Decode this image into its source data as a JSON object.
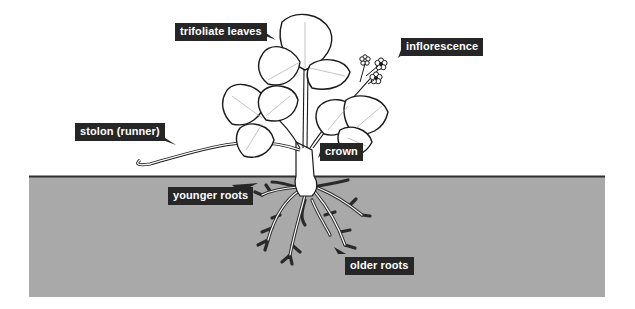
{
  "diagram": {
    "colors": {
      "soil": "#a9a9a9",
      "soil_line": "#2f2f2f",
      "label_bg": "#262626",
      "label_text": "#ffffff",
      "plant_outline": "#1a1a1a",
      "background": "#ffffff"
    },
    "labels": [
      {
        "id": "trifoliate-leaves",
        "text": "trifoliate leaves"
      },
      {
        "id": "inflorescence",
        "text": "inflorescence"
      },
      {
        "id": "stolon",
        "text": "stolon (runner)"
      },
      {
        "id": "crown",
        "text": "crown"
      },
      {
        "id": "younger-roots",
        "text": "younger roots"
      },
      {
        "id": "older-roots",
        "text": "older roots"
      }
    ]
  }
}
